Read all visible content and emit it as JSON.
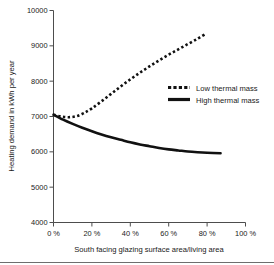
{
  "chart_data": {
    "type": "line",
    "title": "",
    "xlabel": "South facing glazing surface area/living area",
    "ylabel": "Heating demand in kWh per year",
    "xlim": [
      0,
      100
    ],
    "ylim": [
      4000,
      10000
    ],
    "grid": false,
    "legend_position": "right-middle",
    "x_tick_labels": [
      "0 %",
      "20 %",
      "40 %",
      "60 %",
      "80 %",
      "100 %"
    ],
    "x_tick_values": [
      0,
      20,
      40,
      60,
      80,
      100
    ],
    "y_tick_labels": [
      "4000",
      "5000",
      "6000",
      "7000",
      "8000",
      "9000",
      "10000"
    ],
    "y_tick_values": [
      4000,
      5000,
      6000,
      7000,
      8000,
      9000,
      10000
    ],
    "series": [
      {
        "name": "Low thermal mass",
        "style": "dashed",
        "color": "#111111",
        "x": [
          0,
          4,
          8,
          12,
          16,
          20,
          25,
          30,
          35,
          40,
          45,
          50,
          55,
          60,
          65,
          70,
          75,
          79
        ],
        "values": [
          7050,
          7000,
          6980,
          7010,
          7100,
          7230,
          7430,
          7640,
          7850,
          8050,
          8240,
          8420,
          8590,
          8750,
          8900,
          9050,
          9200,
          9330
        ]
      },
      {
        "name": "High thermal mass",
        "style": "solid",
        "color": "#111111",
        "x": [
          0,
          5,
          10,
          15,
          20,
          25,
          30,
          35,
          40,
          45,
          50,
          55,
          60,
          65,
          70,
          75,
          80,
          87
        ],
        "values": [
          7050,
          6910,
          6790,
          6680,
          6580,
          6490,
          6410,
          6340,
          6270,
          6210,
          6160,
          6110,
          6070,
          6040,
          6010,
          5990,
          5975,
          5960
        ]
      }
    ]
  },
  "legend": {
    "entries": [
      {
        "label": "Low thermal mass",
        "style": "dashed"
      },
      {
        "label": "High thermal mass",
        "style": "solid"
      }
    ]
  }
}
